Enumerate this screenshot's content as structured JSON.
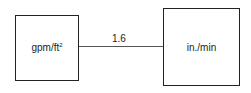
{
  "diagram": {
    "left_node": {
      "label": "gpm/ft",
      "superscript": "2"
    },
    "right_node": {
      "label": "in./min"
    },
    "edge": {
      "label": "1.6"
    }
  }
}
